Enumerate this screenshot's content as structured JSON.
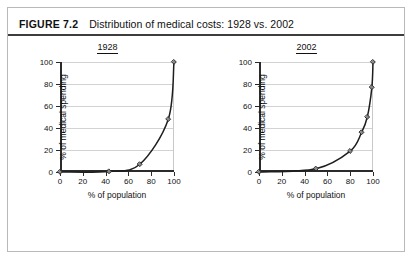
{
  "figure": {
    "number_label": "FIGURE 7.2",
    "title": "Distribution of medical costs: 1928 vs. 2002"
  },
  "colors": {
    "frame_border": "#b9b9b9",
    "header_rule": "#3d3d3d",
    "axis": "#2b2b2b",
    "gridline": "#d2d2d2",
    "curve": "#1e1e1e",
    "marker_fill": "#8a8a8a"
  },
  "chart_data": [
    {
      "type": "line",
      "title": "1928",
      "xlabel": "% of population",
      "ylabel": "% of medical spending",
      "xlim": [
        0,
        100
      ],
      "ylim": [
        0,
        100
      ],
      "xticks": [
        0,
        20,
        40,
        60,
        80,
        100
      ],
      "yticks": [
        0,
        20,
        40,
        60,
        80,
        100
      ],
      "xticklabels": [
        "0",
        "20",
        "40",
        "60",
        "80",
        "100"
      ],
      "yticklabels": [
        "0",
        "20",
        "40",
        "60",
        "80",
        "100"
      ],
      "grid": "horizontal",
      "legend": "none",
      "markers": true,
      "x": [
        0,
        43,
        70,
        95,
        100
      ],
      "y": [
        0,
        0.5,
        7,
        48,
        100
      ]
    },
    {
      "type": "line",
      "title": "2002",
      "xlabel": "% of population",
      "ylabel": "% of medical spending",
      "xlim": [
        0,
        100
      ],
      "ylim": [
        0,
        100
      ],
      "xticks": [
        0,
        20,
        40,
        60,
        80,
        100
      ],
      "yticks": [
        0,
        20,
        40,
        60,
        80,
        100
      ],
      "xticklabels": [
        "0",
        "20",
        "40",
        "60",
        "80",
        "100"
      ],
      "yticklabels": [
        "0",
        "20",
        "40",
        "60",
        "80",
        "100"
      ],
      "grid": "horizontal",
      "legend": "none",
      "markers": true,
      "x": [
        0,
        50,
        80,
        90,
        95,
        99,
        100
      ],
      "y": [
        0,
        3,
        19,
        36,
        50,
        77,
        100
      ]
    }
  ]
}
